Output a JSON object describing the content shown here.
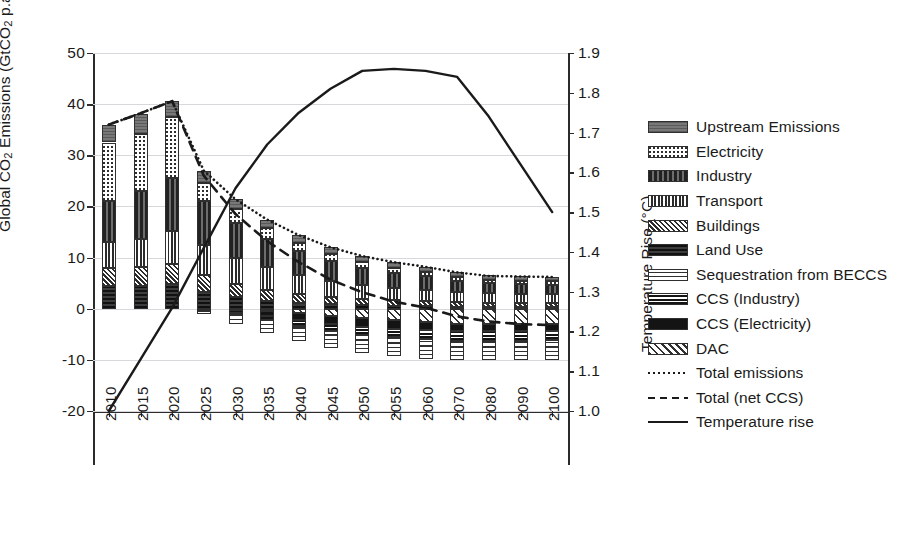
{
  "chart_data": {
    "type": "bar",
    "title": "",
    "subtitle": "",
    "xlabel": "",
    "ylabel": "Global CO₂ Emissions (GtCO₂ p.a.)",
    "ylabel_right": "Temperature Rise (°C)",
    "categories": [
      "2010",
      "2015",
      "2020",
      "2025",
      "2030",
      "2035",
      "2040",
      "2045",
      "2050",
      "2055",
      "2060",
      "2070",
      "2080",
      "2090",
      "2100"
    ],
    "ylim": [
      -20,
      50
    ],
    "yticks": [
      50,
      40,
      30,
      20,
      10,
      0,
      -10,
      -20
    ],
    "ylim_right": [
      1.0,
      1.9
    ],
    "yticks_right": [
      "1.9",
      "1.8",
      "1.7",
      "1.6",
      "1.5",
      "1.4",
      "1.3",
      "1.2",
      "1.1",
      "1.0"
    ],
    "grid": true,
    "legend_position": "right",
    "stacked": true,
    "series": [
      {
        "name": "Upstream Emissions",
        "key": "upstream",
        "pattern": "horizontal-lines-grey",
        "values": [
          3.5,
          4.0,
          3.2,
          2.5,
          2.0,
          1.7,
          1.5,
          1.3,
          1.2,
          1.1,
          1.0,
          0.9,
          0.8,
          0.8,
          0.8
        ]
      },
      {
        "name": "Electricity",
        "key": "electricity",
        "pattern": "checker-dots",
        "values": [
          11.5,
          11.0,
          11.8,
          3.5,
          2.6,
          2.0,
          1.7,
          1.4,
          1.2,
          1.0,
          0.9,
          0.8,
          0.7,
          0.7,
          0.7
        ]
      },
      {
        "name": "Industry",
        "key": "industry",
        "pattern": "dense-dark",
        "values": [
          8.0,
          9.5,
          10.5,
          8.5,
          6.8,
          5.6,
          4.6,
          3.9,
          3.3,
          2.9,
          2.6,
          2.2,
          2.0,
          1.9,
          1.8
        ]
      },
      {
        "name": "Transport",
        "key": "transport",
        "pattern": "grid-mesh",
        "values": [
          5.0,
          5.5,
          6.3,
          6.0,
          5.2,
          4.4,
          3.7,
          3.1,
          2.7,
          2.4,
          2.2,
          1.9,
          1.8,
          1.7,
          1.7
        ]
      },
      {
        "name": "Buildings",
        "key": "buildings",
        "pattern": "cross-hatch-fine",
        "values": [
          3.5,
          3.6,
          4.0,
          3.3,
          2.6,
          2.1,
          1.7,
          1.4,
          1.2,
          1.1,
          1.0,
          0.9,
          0.8,
          0.8,
          0.8
        ]
      },
      {
        "name": "Land Use",
        "key": "landuse",
        "pattern": "solid-dark",
        "values": [
          4.5,
          4.5,
          4.8,
          3.2,
          2.2,
          1.6,
          1.2,
          0.9,
          0.7,
          0.6,
          0.5,
          0.4,
          0.4,
          0.4,
          0.4
        ]
      },
      {
        "name": "Sequestration from BECCS",
        "key": "beccs",
        "pattern": "wavy",
        "values": [
          0,
          0,
          0,
          -0.6,
          -1.6,
          -2.4,
          -3.0,
          -3.4,
          -3.6,
          -3.7,
          -3.8,
          -3.8,
          -3.8,
          -3.8,
          -3.8
        ]
      },
      {
        "name": "CCS (Industry)",
        "key": "ccs_industry",
        "pattern": "thin-bands",
        "values": [
          0,
          0,
          0,
          -0.2,
          -0.5,
          -0.8,
          -1.1,
          -1.4,
          -1.6,
          -1.7,
          -1.8,
          -1.9,
          -1.9,
          -1.9,
          -1.9
        ]
      },
      {
        "name": "CCS (Electricity)",
        "key": "ccs_electricity",
        "pattern": "solid-black",
        "values": [
          0,
          0,
          0,
          -0.2,
          -0.6,
          -1.0,
          -1.3,
          -1.5,
          -1.6,
          -1.6,
          -1.6,
          -1.5,
          -1.4,
          -1.4,
          -1.3
        ]
      },
      {
        "name": "DAC",
        "key": "dac",
        "pattern": "diagonal-hatch",
        "values": [
          0,
          0,
          0,
          0,
          -0.2,
          -0.5,
          -0.9,
          -1.4,
          -1.9,
          -2.3,
          -2.6,
          -2.9,
          -3.0,
          -3.0,
          -3.0
        ]
      }
    ],
    "lines": [
      {
        "name": "Total emissions",
        "style": "dotted",
        "values": [
          36.0,
          38.2,
          40.6,
          27.0,
          21.4,
          17.4,
          14.4,
          12.0,
          10.3,
          9.1,
          8.2,
          7.1,
          6.4,
          6.3,
          6.2
        ]
      },
      {
        "name": "Total (net CCS)",
        "style": "dashed",
        "values": [
          36.0,
          38.2,
          40.6,
          26.0,
          18.5,
          13.2,
          9.1,
          5.7,
          3.2,
          1.4,
          0.2,
          -1.5,
          -2.5,
          -3.0,
          -3.2
        ]
      },
      {
        "name": "Temperature rise",
        "style": "solid",
        "axis": "right",
        "values": [
          1.0,
          1.13,
          1.26,
          1.41,
          1.56,
          1.67,
          1.75,
          1.81,
          1.855,
          1.86,
          1.855,
          1.84,
          1.74,
          1.62,
          1.5
        ]
      }
    ],
    "legend_entries": [
      {
        "label": "Upstream Emissions",
        "kind": "swatch",
        "swatch_class": "p-upstream"
      },
      {
        "label": "Electricity",
        "kind": "swatch",
        "swatch_class": "p-electricity"
      },
      {
        "label": "Industry",
        "kind": "swatch",
        "swatch_class": "p-industry"
      },
      {
        "label": "Transport",
        "kind": "swatch",
        "swatch_class": "p-transport"
      },
      {
        "label": "Buildings",
        "kind": "swatch",
        "swatch_class": "p-buildings"
      },
      {
        "label": "Land Use",
        "kind": "swatch",
        "swatch_class": "p-landuse"
      },
      {
        "label": "Sequestration from BECCS",
        "kind": "swatch",
        "swatch_class": "p-beccs"
      },
      {
        "label": "CCS (Industry)",
        "kind": "swatch",
        "swatch_class": "p-ccs-ind"
      },
      {
        "label": "CCS (Electricity)",
        "kind": "swatch",
        "swatch_class": "p-ccs-elec"
      },
      {
        "label": "DAC",
        "kind": "swatch",
        "swatch_class": "p-dac"
      },
      {
        "label": "Total emissions",
        "kind": "line",
        "swatch_class": "ln-dot"
      },
      {
        "label": "Total (net CCS)",
        "kind": "line",
        "swatch_class": "ln-dash"
      },
      {
        "label": "Temperature rise",
        "kind": "line",
        "swatch_class": "ln-solid"
      }
    ]
  },
  "colors": {
    "ink": "#1a1a1a",
    "axis": "#2b2b2b",
    "grid": "#d8d8dc",
    "background": "#ffffff"
  }
}
